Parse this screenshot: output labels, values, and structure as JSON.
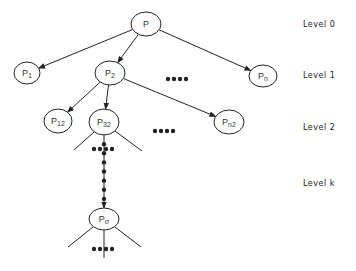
{
  "diagram": {
    "type": "tree",
    "title": "",
    "colors": {
      "stroke": "#222222",
      "text": "#333333",
      "background": "#ffffff"
    },
    "nodes": [
      {
        "id": "p",
        "base": "P",
        "sub": "",
        "cx": 146,
        "cy": 24,
        "rx": 15,
        "ry": 12,
        "level": 0
      },
      {
        "id": "p1",
        "base": "P",
        "sub": "1",
        "cx": 27,
        "cy": 73,
        "rx": 13,
        "ry": 11,
        "level": 1
      },
      {
        "id": "p2",
        "base": "P",
        "sub": "2",
        "cx": 110,
        "cy": 73,
        "rx": 15,
        "ry": 12,
        "level": 1
      },
      {
        "id": "pn",
        "base": "P",
        "sub": "n",
        "cx": 263,
        "cy": 76,
        "rx": 14,
        "ry": 11,
        "level": 1
      },
      {
        "id": "p12",
        "base": "P",
        "sub": "12",
        "cx": 58,
        "cy": 121,
        "rx": 14,
        "ry": 12,
        "level": 2
      },
      {
        "id": "p32",
        "base": "P",
        "sub": "32",
        "cx": 104,
        "cy": 122,
        "rx": 15,
        "ry": 13,
        "level": 2
      },
      {
        "id": "pn2",
        "base": "P",
        "sub": "n2",
        "cx": 229,
        "cy": 122,
        "rx": 15,
        "ry": 12,
        "level": 2
      },
      {
        "id": "psigma",
        "base": "P",
        "sub": "σ",
        "cx": 104,
        "cy": 219,
        "rx": 15,
        "ry": 11,
        "level": "k"
      }
    ],
    "edges": [
      {
        "from": "p",
        "to": "p1",
        "arrow": true
      },
      {
        "from": "p",
        "to": "p2",
        "arrow": true
      },
      {
        "from": "p",
        "to": "pn",
        "arrow": true
      },
      {
        "from": "p2",
        "to": "p12",
        "arrow": true
      },
      {
        "from": "p2",
        "to": "p32",
        "arrow": true
      },
      {
        "from": "p2",
        "to": "pn2",
        "arrow": true
      },
      {
        "from": "p32",
        "to": "psigma",
        "arrow": true,
        "style": "dotted"
      }
    ],
    "ellipsis_marks": [
      {
        "id": "level1-dots",
        "x": 168,
        "y": 79,
        "count": 4
      },
      {
        "id": "level2-dots",
        "x": 155,
        "y": 131,
        "count": 4
      },
      {
        "id": "p32-children-dots",
        "x": 94,
        "y": 149,
        "count": 4
      },
      {
        "id": "psigma-children-dots",
        "x": 94,
        "y": 249,
        "count": 4
      }
    ],
    "levels": [
      {
        "label": "Level 0",
        "y": 27
      },
      {
        "label": "Level 1",
        "y": 78
      },
      {
        "label": "Level 2",
        "y": 130
      },
      {
        "label": "Level k",
        "y": 186
      }
    ]
  }
}
